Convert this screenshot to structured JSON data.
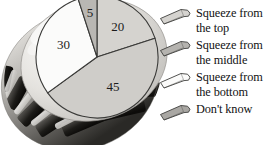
{
  "figure": {
    "background_color": "#ffffff",
    "illustration": {
      "name": "toothpaste-tube-cap-photo",
      "description": "ribbed bottle cap photograph",
      "tones": {
        "highlight": "#f2f1ef",
        "light": "#d8d6d2",
        "mid": "#a9a7a3",
        "dark": "#4a4845",
        "darkest": "#15140f"
      }
    }
  },
  "chart_data": {
    "type": "pie",
    "title": "",
    "subtitle": "",
    "xlabel": "",
    "ylabel": "",
    "legend_position": "right",
    "grid": false,
    "units": "percent",
    "categories": [
      "Squeeze from the top",
      "Squeeze from the middle",
      "Squeeze from the bottom",
      "Don't know"
    ],
    "values": [
      20,
      45,
      30,
      5
    ],
    "labels": [
      "20",
      "45",
      "30",
      "5"
    ],
    "slice_colors": [
      "#d5d3cf",
      "#cfcdc9",
      "#fbfbfa",
      "#b9b7b3"
    ],
    "start_angle_deg": -90,
    "direction": "clockwise",
    "outline_color": "#3a3a38"
  },
  "legend": {
    "items": [
      {
        "label": "Squeeze from\nthe top",
        "swatch_name": "tube-swatch-top",
        "swatch_fill": "#d5d3cf",
        "swatch_stroke": "#3f3f3d"
      },
      {
        "label": "Squeeze from\nthe middle",
        "swatch_name": "tube-swatch-middle",
        "swatch_fill": "#b5b3af",
        "swatch_stroke": "#3f3f3d"
      },
      {
        "label": "Squeeze from\nthe bottom",
        "swatch_name": "tube-swatch-bottom",
        "swatch_fill": "#fbfbfa",
        "swatch_stroke": "#3f3f3d"
      },
      {
        "label": "Don't know",
        "swatch_name": "tube-swatch-dont-know",
        "swatch_fill": "#a9a7a3",
        "swatch_stroke": "#3f3f3d"
      }
    ]
  }
}
